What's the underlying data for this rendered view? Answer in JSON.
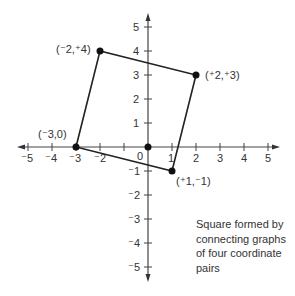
{
  "diagram": {
    "type": "coordinate-plane",
    "caption": "Square formed by connecting graphs of four coordinate pairs",
    "x_ticks": [
      "⁻5",
      "⁻4",
      "⁻3",
      "⁻2",
      "",
      "0",
      "1",
      "2",
      "3",
      "4",
      "5"
    ],
    "y_ticks": [
      "5",
      "4",
      "3",
      "2",
      "1",
      "⁻1",
      "⁻2",
      "⁻3",
      "⁻4",
      "⁻5"
    ],
    "origin_label": "0",
    "points": [
      {
        "label": "(⁻3,0)",
        "x": -3,
        "y": 0
      },
      {
        "label": "(⁻2,⁺4)",
        "x": -2,
        "y": 4
      },
      {
        "label": "(⁺2,⁺3)",
        "x": 2,
        "y": 3
      },
      {
        "label": "(⁺1,⁻1)",
        "x": 1,
        "y": -1
      }
    ],
    "labels": {
      "p1": "(⁻3,0)",
      "p2": "(⁻2,⁺4)",
      "p3": "(⁺2,⁺3)",
      "p4": "(⁺1,⁻1)"
    },
    "xt": {
      "m5": "⁻5",
      "m4": "⁻4",
      "m3": "⁻3",
      "m2": "⁻2",
      "zero": "0",
      "p1": "1",
      "p2": "2",
      "p3": "3",
      "p4": "4",
      "p5": "5"
    },
    "yt": {
      "p5": "5",
      "p4": "4",
      "p3": "3",
      "p2": "2",
      "p1": "1",
      "m1": "⁻1",
      "m2": "⁻2",
      "m3": "⁻3",
      "m4": "⁻4",
      "m5": "⁻5"
    }
  }
}
